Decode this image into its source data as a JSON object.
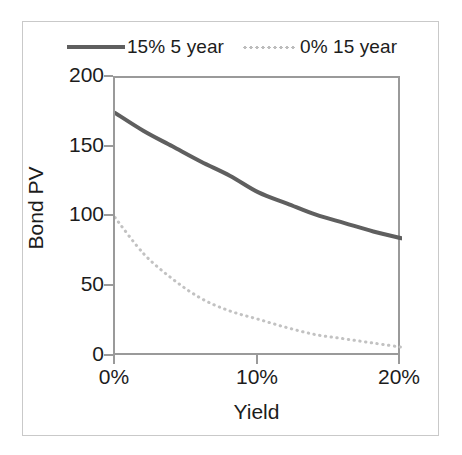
{
  "figure": {
    "frame_color": "#c9c9c9",
    "background": "#ffffff"
  },
  "legend": {
    "position": "top-center",
    "entries": [
      {
        "label": "15% 5 year",
        "style": "solid",
        "color": "#5f5f5f",
        "icon": "solid-line-swatch"
      },
      {
        "label": "0% 15 year",
        "style": "dotted",
        "color": "#bdbdbd",
        "icon": "dotted-line-swatch"
      }
    ]
  },
  "axes": {
    "x_title": "Yield",
    "y_title": "Bond PV",
    "x_ticks": [
      "0%",
      "10%",
      "20%"
    ],
    "y_ticks": [
      "0",
      "50",
      "100",
      "150",
      "200"
    ],
    "axis_color": "#9a9a9a",
    "text_color": "#1c1c1c"
  },
  "chart_data": {
    "type": "line",
    "title": "",
    "xlabel": "Yield",
    "ylabel": "Bond PV",
    "xlim": [
      0,
      20
    ],
    "ylim": [
      0,
      200
    ],
    "xtick_values": [
      0,
      10,
      20
    ],
    "xtick_labels": [
      "0%",
      "10%",
      "20%"
    ],
    "ytick_values": [
      0,
      50,
      100,
      150,
      200
    ],
    "ytick_labels": [
      "0",
      "50",
      "100",
      "150",
      "200"
    ],
    "grid": false,
    "legend_position": "top-center",
    "x": [
      0,
      1,
      2,
      3,
      4,
      5,
      6,
      7,
      8,
      9,
      10,
      11,
      12,
      13,
      14,
      15,
      16,
      17,
      18,
      19,
      20
    ],
    "series": [
      {
        "name": "15% 5 year",
        "style": "solid",
        "color": "#5f5f5f",
        "values": [
          175,
          170.5,
          166.2,
          162.1,
          158.2,
          154.4,
          150.8,
          147.3,
          144.0,
          140.8,
          137.7,
          134.8,
          131.9,
          129.2,
          126.5,
          124.0,
          121.5,
          119.1,
          116.8,
          114.6,
          112.5
        ]
      },
      {
        "name": "0% 15 year",
        "style": "dotted",
        "color": "#bdbdbd",
        "values": [
          100,
          86.1,
          74.3,
          64.2,
          55.5,
          48.1,
          41.7,
          36.2,
          31.5,
          27.5,
          23.9,
          20.9,
          18.3,
          16.0,
          14.0,
          12.3,
          10.8,
          9.5,
          8.4,
          7.4,
          6.5
        ]
      }
    ],
    "rendered_series_points": {
      "15% 5 year": [
        {
          "x": 0,
          "y": 175
        },
        {
          "x": 2,
          "y": 162
        },
        {
          "x": 4,
          "y": 151
        },
        {
          "x": 6,
          "y": 140
        },
        {
          "x": 8,
          "y": 130
        },
        {
          "x": 10,
          "y": 118
        },
        {
          "x": 12,
          "y": 110
        },
        {
          "x": 14,
          "y": 102
        },
        {
          "x": 16,
          "y": 96
        },
        {
          "x": 18,
          "y": 90
        },
        {
          "x": 20,
          "y": 85
        }
      ],
      "0% 15 year": [
        {
          "x": 0,
          "y": 100
        },
        {
          "x": 2,
          "y": 74
        },
        {
          "x": 4,
          "y": 56
        },
        {
          "x": 6,
          "y": 42
        },
        {
          "x": 8,
          "y": 33
        },
        {
          "x": 10,
          "y": 27
        },
        {
          "x": 12,
          "y": 21
        },
        {
          "x": 14,
          "y": 16
        },
        {
          "x": 16,
          "y": 13
        },
        {
          "x": 18,
          "y": 10
        },
        {
          "x": 20,
          "y": 7
        }
      ]
    }
  }
}
